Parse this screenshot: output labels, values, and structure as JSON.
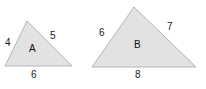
{
  "figure": {
    "width": 206,
    "height": 89,
    "background_color": "#ffffff",
    "shape_fill_color": "#e2e2e2",
    "shape_stroke_color": "#b4b4b4",
    "label_color": "#1a1a1a"
  },
  "shapes": [
    {
      "name": "A",
      "type": "triangle",
      "points": "27,21 72,66 5,66",
      "sides": {
        "left": "4",
        "right": "5",
        "base": "6"
      }
    },
    {
      "name": "B",
      "type": "triangle",
      "points": "134,7 196,67 92,67",
      "sides": {
        "left": "6",
        "right": "7",
        "base": "8"
      }
    }
  ]
}
